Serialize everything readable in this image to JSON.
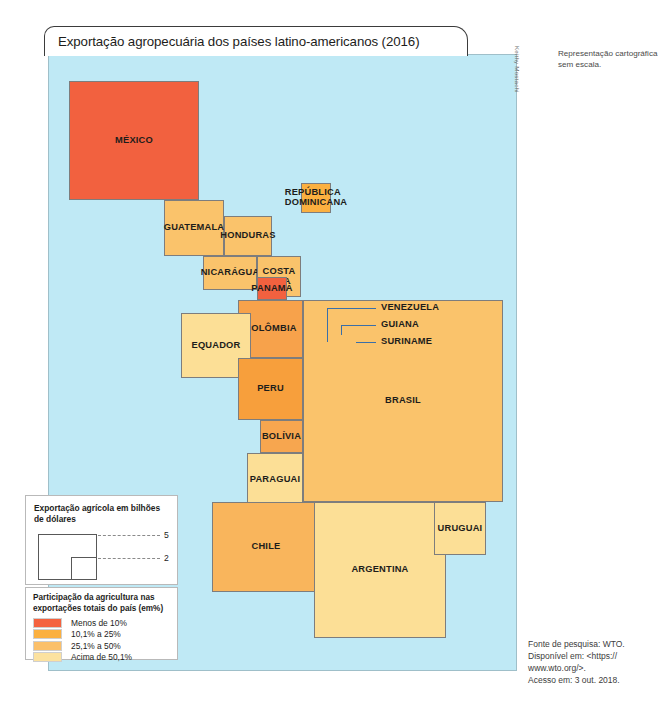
{
  "title": "Exportação agropecuária dos países latino-americanos (2016)",
  "credit": "Keithy Mostachi",
  "scale_note": "Representação cartográfica sem escala.",
  "map": {
    "ocean_color": "#bfe9f5",
    "countries": [
      {
        "name": "MÉXICO",
        "label": "MÉXICO",
        "class": "under10",
        "color": "#f2613f",
        "x": 20,
        "y": 26,
        "w": 130,
        "h": 119,
        "label_pos": "inside"
      },
      {
        "name": "GUATEMALA",
        "label": "GUATEMALA",
        "class": "pct10_25",
        "color": "#fac36b",
        "x": 115,
        "y": 145,
        "w": 60,
        "h": 56,
        "label_pos": "inside"
      },
      {
        "name": "HONDURAS",
        "label": "HONDURAS",
        "class": "pct10_25",
        "color": "#fac36b",
        "x": 175,
        "y": 161,
        "w": 48,
        "h": 40,
        "label_pos": "inside"
      },
      {
        "name": "NICARÁGUA",
        "label": "NICARÁGUA",
        "class": "pct10_25",
        "color": "#fac36b",
        "x": 154,
        "y": 201,
        "w": 54,
        "h": 34,
        "label_pos": "inside"
      },
      {
        "name": "COSTA RICA",
        "label": "COSTA\nRICA",
        "class": "pct10_25",
        "color": "#fac36b",
        "x": 208,
        "y": 201,
        "w": 44,
        "h": 41,
        "label_pos": "inside"
      },
      {
        "name": "PANAMÁ",
        "label": "PANAMÁ",
        "class": "under10",
        "color": "#f2613f",
        "x": 208,
        "y": 222,
        "w": 30,
        "h": 23,
        "label_pos": "overlap"
      },
      {
        "name": "REPÚBLICA DOMINICANA",
        "label": "REPÚBLICA\nDOMINICANA",
        "class": "pct10_25",
        "color": "#fbb040",
        "x": 252,
        "y": 128,
        "w": 30,
        "h": 30,
        "label_pos": "overlap"
      },
      {
        "name": "COLÔMBIA",
        "label": "COLÔMBIA",
        "class": "pct25_50",
        "color": "#f7a24b",
        "x": 189,
        "y": 245,
        "w": 65,
        "h": 58,
        "label_pos": "inside"
      },
      {
        "name": "VENEZUELA",
        "label": "VENEZUELA",
        "class": "pct10_25",
        "color": "#fbb040",
        "x": 274,
        "y": 287,
        "w": 8,
        "h": 9,
        "label_pos": "leader"
      },
      {
        "name": "GUIANA",
        "label": "GUIANA",
        "class": "pct10_25",
        "color": "#fbb040",
        "x": 283,
        "y": 280,
        "w": 18,
        "h": 16,
        "label_pos": "leader"
      },
      {
        "name": "SURINAME",
        "label": "SURINAME",
        "class": "under10",
        "color": "#f2613f",
        "x": 301,
        "y": 285,
        "w": 11,
        "h": 11,
        "label_pos": "leader"
      },
      {
        "name": "EQUADOR",
        "label": "EQUADOR",
        "class": "over50",
        "color": "#fcdf96",
        "x": 132,
        "y": 258,
        "w": 70,
        "h": 65,
        "label_pos": "inside"
      },
      {
        "name": "PERU",
        "label": "PERU",
        "class": "pct25_50",
        "color": "#f79f3c",
        "x": 189,
        "y": 303,
        "w": 65,
        "h": 62,
        "label_pos": "inside"
      },
      {
        "name": "BOLÍVIA",
        "label": "BOLÍVIA",
        "class": "pct25_50",
        "color": "#f7a64f",
        "x": 211,
        "y": 365,
        "w": 43,
        "h": 33,
        "label_pos": "overlap"
      },
      {
        "name": "BRASIL",
        "label": "BRASIL",
        "class": "pct10_25",
        "color": "#fac36b",
        "x": 254,
        "y": 245,
        "w": 200,
        "h": 202,
        "label_pos": "inside"
      },
      {
        "name": "PARAGUAI",
        "label": "PARAGUAI",
        "class": "over50",
        "color": "#fcdf96",
        "x": 198,
        "y": 398,
        "w": 56,
        "h": 54,
        "label_pos": "overlap"
      },
      {
        "name": "CHILE",
        "label": "CHILE",
        "class": "pct25_50",
        "color": "#f9b55c",
        "x": 163,
        "y": 447,
        "w": 108,
        "h": 90,
        "label_pos": "inside"
      },
      {
        "name": "ARGENTINA",
        "label": "ARGENTINA",
        "class": "over50",
        "color": "#fcdf96",
        "x": 265,
        "y": 447,
        "w": 132,
        "h": 136,
        "label_pos": "inside"
      },
      {
        "name": "URUGUAI",
        "label": "URUGUAI",
        "class": "over50",
        "color": "#fcdf96",
        "x": 385,
        "y": 447,
        "w": 52,
        "h": 53,
        "label_pos": "overlap"
      }
    ]
  },
  "size_legend": {
    "title": "Exportação agrícola em bilhões de dólares",
    "big_value": "5",
    "small_value": "2"
  },
  "color_legend": {
    "title": "Participação da agricultura nas exportações totais do país (em%)",
    "items": [
      {
        "label": "Menos de 10%",
        "color": "#f4623f"
      },
      {
        "label": "10,1% a 25%",
        "color": "#fbb040"
      },
      {
        "label": "25,1% a 50%",
        "color": "#fbc06a"
      },
      {
        "label": "Acima de 50,1%",
        "color": "#fce2a0"
      }
    ]
  },
  "source": {
    "line1": "Fonte de pesquisa: WTO.",
    "line2": "Disponível em: <https://",
    "line3": "www.wto.org/>.",
    "line4": "Acesso em: 3 out. 2018."
  }
}
